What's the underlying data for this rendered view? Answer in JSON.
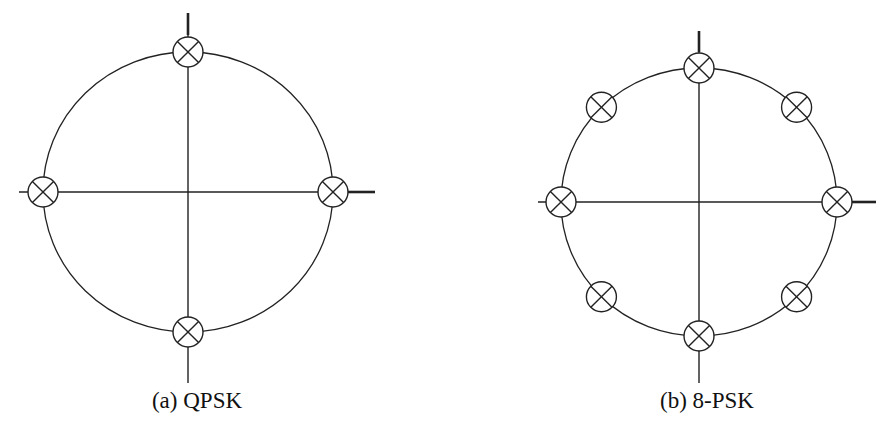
{
  "figure": {
    "panels": [
      {
        "id": "qpsk",
        "caption": "(a) QPSK",
        "caption_pos": {
          "x": 197,
          "y": 388
        },
        "center": {
          "x": 188,
          "y": 192
        },
        "radius": {
          "rx": 145,
          "ry": 140
        },
        "axes": {
          "h": {
            "x1": 19,
            "x2": 375,
            "y": 192
          },
          "v": {
            "x": 188,
            "y1": 13,
            "y2": 383
          },
          "h_thick_from": 345,
          "v_thick_to": 35
        },
        "points_deg": [
          0,
          90,
          180,
          270
        ]
      },
      {
        "id": "8psk",
        "caption": "(b) 8-PSK",
        "caption_pos": {
          "x": 707,
          "y": 388
        },
        "center": {
          "x": 699,
          "y": 202
        },
        "radius": {
          "rx": 138,
          "ry": 134
        },
        "axes": {
          "h": {
            "x1": 538,
            "x2": 876,
            "y": 202
          },
          "v": {
            "x": 699,
            "y1": 31,
            "y2": 383
          },
          "h_thick_from": 852,
          "v_thick_to": 52
        },
        "points_deg": [
          0,
          45,
          90,
          135,
          180,
          225,
          270,
          315
        ]
      }
    ],
    "marker": {
      "type": "circled-x",
      "radius": 15
    },
    "colors": {
      "line": "#222222",
      "background": "#ffffff",
      "text": "#111111"
    }
  }
}
